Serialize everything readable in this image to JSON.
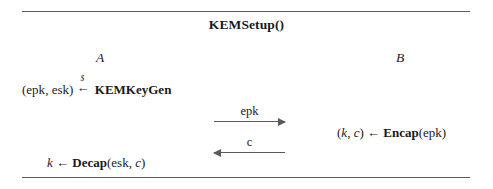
{
  "diagram": {
    "title_function": "KEMSetup",
    "title_parens": "()",
    "parties": {
      "left": "A",
      "right": "B"
    },
    "rules": {
      "top": "horizontal-rule",
      "bottom": "horizontal-rule"
    },
    "steps": {
      "keygen": {
        "output_open": "(",
        "output_pk": "epk",
        "output_sep": ", ",
        "output_sk": "esk",
        "output_close": ")",
        "assign_symbol": "←",
        "assign_superscript": "$",
        "algorithm": "KEMKeyGen"
      },
      "encap": {
        "output_open": "(",
        "output_key": "k",
        "output_sep": ", ",
        "output_ct": "c",
        "output_close": ")",
        "assign_symbol": "←",
        "algorithm": "Encap",
        "arg_open": "(",
        "arg": "epk",
        "arg_close": ")"
      },
      "decap": {
        "output_key": "k",
        "assign_symbol": "←",
        "algorithm": "Decap",
        "arg_open": "(",
        "arg_sk": "esk",
        "arg_sep": ", ",
        "arg_ct": "c",
        "arg_close": ")"
      }
    },
    "messages": [
      {
        "label": "epk",
        "direction": "right",
        "from": "A",
        "to": "B"
      },
      {
        "label": "c",
        "direction": "left",
        "from": "B",
        "to": "A"
      }
    ]
  }
}
